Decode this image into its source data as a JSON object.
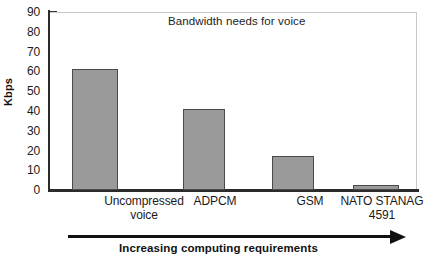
{
  "chart_data": {
    "type": "bar",
    "title": "Bandwidth needs for voice",
    "xlabel": "",
    "ylabel": "Kbps",
    "categories": [
      "Uncompressed voice",
      "ADPCM",
      "GSM",
      "NATO STANAG 4591"
    ],
    "category_lines": [
      [
        "Uncompressed",
        "voice"
      ],
      [
        "ADPCM",
        ""
      ],
      [
        "GSM",
        ""
      ],
      [
        "NATO STANAG",
        "4591"
      ]
    ],
    "values": [
      61,
      41,
      17,
      2.4
    ],
    "ylim": [
      0,
      90
    ],
    "ytick_step": 10,
    "yticks": [
      0,
      10,
      20,
      30,
      40,
      50,
      60,
      70,
      80,
      90
    ],
    "ytick_labels": [
      "0",
      "10",
      "20",
      "30",
      "40",
      "50",
      "60",
      "70",
      "80",
      "90"
    ],
    "grid": false,
    "legend": false,
    "bar_color": "#9a9a9a",
    "bar_edge_color": "#4a4a4a",
    "axis_color": "#2b2b2b",
    "frame_color": "#c9c9c9"
  },
  "annotation": {
    "arrow_caption": "Increasing computing requirements",
    "arrow_direction": "right"
  }
}
